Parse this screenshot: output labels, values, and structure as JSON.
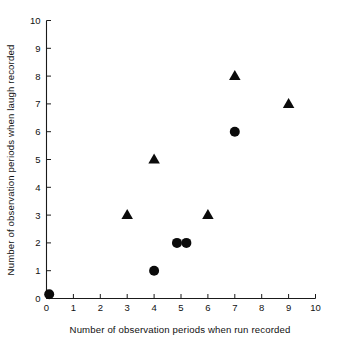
{
  "chart_data": {
    "type": "scatter",
    "title": "",
    "xlabel": "Number of observation periods when run recorded",
    "ylabel": "Number of observation periods when laugh recorded",
    "xlim": [
      0,
      10
    ],
    "ylim": [
      0,
      10
    ],
    "xticks": [
      "0",
      "1",
      "2",
      "3",
      "4",
      "5",
      "6",
      "7",
      "8",
      "9",
      "10"
    ],
    "yticks": [
      "0",
      "1",
      "2",
      "3",
      "4",
      "5",
      "6",
      "7",
      "8",
      "9",
      "10"
    ],
    "grid": false,
    "legend": "none",
    "marker_color": "#0b0b0b",
    "axis_color": "#1a1a1a",
    "background": "#ffffff",
    "series": [
      {
        "name": "triangle-points",
        "marker": "triangle",
        "points": [
          {
            "x": 3,
            "y": 3
          },
          {
            "x": 4,
            "y": 5
          },
          {
            "x": 6,
            "y": 3
          },
          {
            "x": 7,
            "y": 8
          },
          {
            "x": 9,
            "y": 7
          }
        ]
      },
      {
        "name": "circle-points",
        "marker": "circle",
        "points": [
          {
            "x": 0.1,
            "y": 0.15
          },
          {
            "x": 4,
            "y": 1
          },
          {
            "x": 4.85,
            "y": 2
          },
          {
            "x": 5.2,
            "y": 2
          },
          {
            "x": 7,
            "y": 6
          }
        ]
      }
    ]
  }
}
